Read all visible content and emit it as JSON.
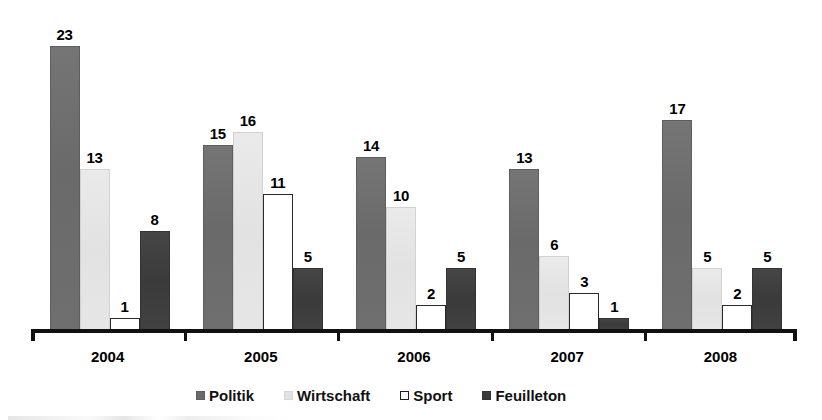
{
  "chart_data": {
    "type": "bar",
    "title": "",
    "xlabel": "",
    "ylabel": "",
    "categories": [
      "2004",
      "2005",
      "2006",
      "2007",
      "2008"
    ],
    "series": [
      {
        "name": "Politik",
        "color": "#6a6a6a",
        "values": [
          23,
          15,
          14,
          13,
          17
        ]
      },
      {
        "name": "Wirtschaft",
        "color": "#e2e2e2",
        "values": [
          13,
          16,
          10,
          6,
          5
        ]
      },
      {
        "name": "Sport",
        "color": "#ffffff",
        "values": [
          1,
          11,
          2,
          3,
          2
        ]
      },
      {
        "name": "Feuilleton",
        "color": "#3b3b3b",
        "values": [
          8,
          5,
          5,
          1,
          5
        ]
      }
    ],
    "ylim": [
      0,
      23
    ],
    "grid": false,
    "legend_position": "bottom",
    "data_labels": true,
    "axis_color": "#111111"
  },
  "legend": {
    "items": [
      {
        "label": "Politik",
        "swatch": "politik"
      },
      {
        "label": "Wirtschaft",
        "swatch": "wirtschaft"
      },
      {
        "label": "Sport",
        "swatch": "sport"
      },
      {
        "label": "Feuilleton",
        "swatch": "feuilleton"
      }
    ]
  },
  "axis": {
    "tick_labels": [
      "2004",
      "2005",
      "2006",
      "2007",
      "2008"
    ]
  }
}
